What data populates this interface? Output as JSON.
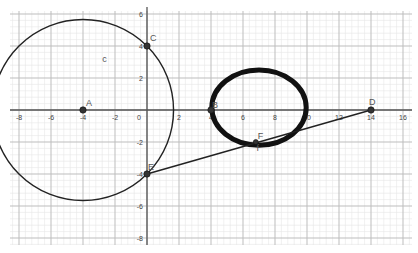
{
  "view": {
    "origin_px": [
      147,
      110
    ],
    "unit_px": 16,
    "x_range": [
      -9,
      16.5
    ],
    "y_range": [
      -8.5,
      6.5
    ]
  },
  "axes": {
    "x_ticks": [
      "-8",
      "-6",
      "-4",
      "-2",
      "0",
      "2",
      "4",
      "6",
      "8",
      "10",
      "12",
      "14",
      "16"
    ],
    "y_ticks": [
      "6",
      "4",
      "2",
      "-2",
      "-4",
      "-6",
      "-8"
    ]
  },
  "points": [
    {
      "name": "A",
      "x": -4,
      "y": 0
    },
    {
      "name": "B",
      "x": 4,
      "y": 0
    },
    {
      "name": "C",
      "x": 0,
      "y": 4
    },
    {
      "name": "D",
      "x": 14,
      "y": 0
    },
    {
      "name": "E",
      "x": 0,
      "y": -4
    },
    {
      "name": "F",
      "x": 6.8,
      "y": -2
    }
  ],
  "labels": {
    "A": "A",
    "B": "B",
    "C": "C",
    "D": "D",
    "E": "E",
    "F": "F",
    "curve_c": "c",
    "curve_f": "f"
  },
  "objects": {
    "circle_c": {
      "center": "A",
      "radius": 5.66,
      "color": "#222222"
    },
    "ellipse_thick": {
      "cx": 7,
      "cy": 0.15,
      "rx": 2.95,
      "ry": 2.35,
      "color": "#111111"
    },
    "segment_ED": {
      "from": "E",
      "to": "D"
    }
  },
  "colors": {
    "grid_major": "#bdbdbd",
    "grid_minor": "#e6e6e6",
    "axis": "#555555",
    "point": "#333333"
  }
}
